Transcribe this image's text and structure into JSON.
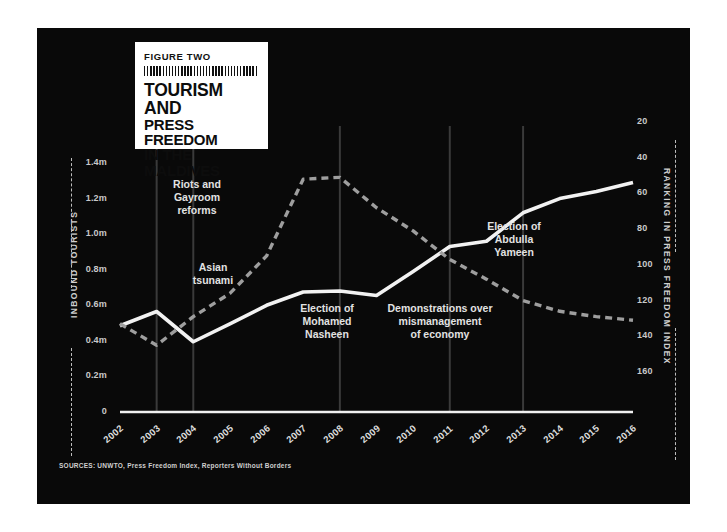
{
  "figure": {
    "label": "FIGURE TWO",
    "title_line1": "TOURISM AND",
    "title_line2": "PRESS FREEDOM",
    "title_line3": "IN THE MALDIVES",
    "source": "SOURCES: UNWTO, Press Freedom Index, Reporters Without Borders",
    "background": "#090909",
    "panel_border": "#ffffff",
    "card_background": "#ffffff"
  },
  "chart_data": {
    "type": "line",
    "title": "TOURISM AND PRESS FREEDOM IN THE MALDIVES",
    "xlabel": "",
    "grid": false,
    "legend_position": "none",
    "x": [
      2002,
      2003,
      2004,
      2005,
      2006,
      2007,
      2008,
      2009,
      2010,
      2011,
      2012,
      2013,
      2014,
      2015,
      2016
    ],
    "categories": [
      "2002",
      "2003",
      "2004",
      "2005",
      "2006",
      "2007",
      "2008",
      "2009",
      "2010",
      "2011",
      "2012",
      "2013",
      "2014",
      "2015",
      "2016"
    ],
    "axes": {
      "left": {
        "label": "INBOUND TOURISTS",
        "ticks": [
          "0",
          "0.2m",
          "0.4m",
          "0.6m",
          "0.8m",
          "1.0m",
          "1.2m",
          "1.4m"
        ],
        "tick_values": [
          0,
          0.2,
          0.4,
          0.6,
          0.8,
          1.0,
          1.2,
          1.4
        ],
        "ylim": [
          0,
          1.4
        ],
        "color": "#ffffff"
      },
      "right": {
        "label": "RANKING IN PRESS FREEDOM INDEX",
        "ticks": [
          "20",
          "40",
          "60",
          "80",
          "100",
          "120",
          "140",
          "160"
        ],
        "tick_values": [
          20,
          40,
          60,
          80,
          100,
          120,
          140,
          160
        ],
        "ylim": [
          170,
          10
        ],
        "inverted": true,
        "color": "#9a9a9a"
      }
    },
    "series": [
      {
        "name": "Inbound tourists",
        "axis": "left",
        "style": "solid",
        "color": "#f2f2f2",
        "values": [
          0.485,
          0.565,
          0.395,
          0.495,
          0.6,
          0.675,
          0.68,
          0.655,
          0.79,
          0.93,
          0.96,
          1.12,
          1.2,
          1.24,
          1.29
        ]
      },
      {
        "name": "Ranking in press freedom index",
        "axis": "right",
        "style": "dashed",
        "color": "#9e9e9e",
        "values": [
          133,
          145,
          129,
          116,
          95,
          52,
          51,
          68,
          81,
          97,
          108,
          120,
          126,
          129,
          131
        ]
      }
    ],
    "annotations": [
      {
        "text": "Riots and\nGayroom\nreforms",
        "year": 2003,
        "marker": true
      },
      {
        "text": "Asian\ntsunami",
        "year": 2004,
        "marker": true
      },
      {
        "text": "Election of\nMohamed\nNasheen",
        "year": 2008,
        "marker": true
      },
      {
        "text": "Demonstrations over\nmismanagement\nof economy",
        "year": 2011,
        "marker": true
      },
      {
        "text": "Election of\nAbdulla\nYameen",
        "year": 2013,
        "marker": true
      }
    ]
  }
}
